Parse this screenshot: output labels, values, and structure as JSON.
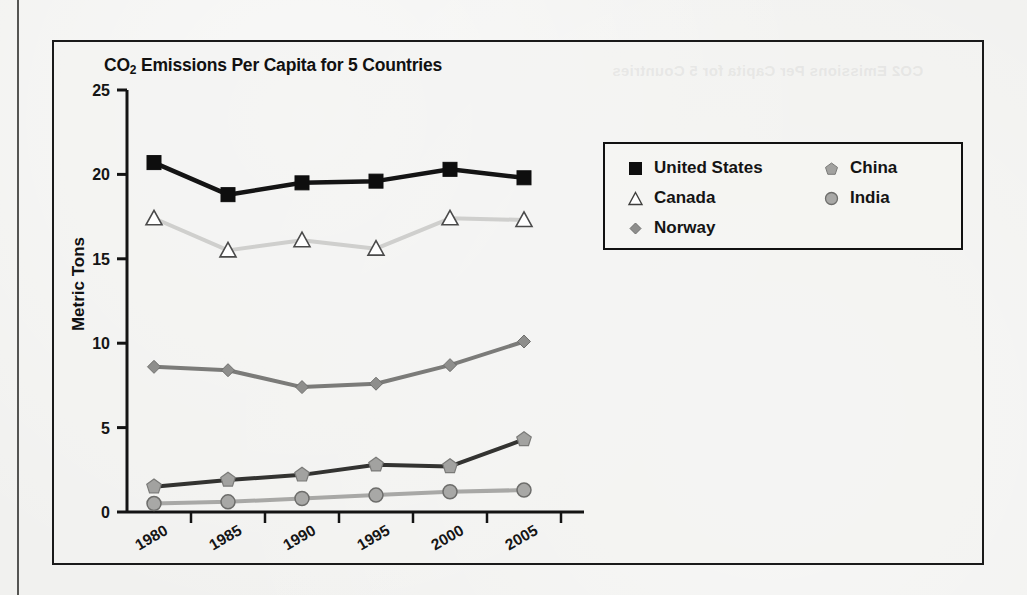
{
  "page": {
    "background_color": "#f1f1ef",
    "edge_line_color": "#555553",
    "showthrough": {
      "title": "CO2 Emissions Per Capita for 5 Countries",
      "line2": "",
      "line3": ""
    }
  },
  "chart_data": {
    "type": "line",
    "title": "CO2 Emissions Per Capita for 5 Countries",
    "title_prefix": "CO",
    "title_sub": "2",
    "title_rest": " Emissions Per Capita for 5 Countries",
    "xlabel": "",
    "ylabel": "Metric Tons",
    "categories": [
      "1980",
      "1985",
      "1990",
      "1995",
      "2000",
      "2005"
    ],
    "x": [
      1980,
      1985,
      1990,
      1995,
      2000,
      2005
    ],
    "ylim": [
      0,
      25
    ],
    "yticks": [
      0,
      5,
      10,
      15,
      20,
      25
    ],
    "ytick_labels": [
      "0",
      "5",
      "10",
      "15",
      "20",
      "25"
    ],
    "grid": false,
    "legend_position": "upper-right-inside",
    "series": [
      {
        "name": "United States",
        "marker": "square",
        "marker_fill": "#0e0e0e",
        "marker_stroke": "#0e0e0e",
        "line_color": "#141414",
        "line_width": 4.5,
        "values": [
          20.7,
          18.8,
          19.5,
          19.6,
          20.3,
          19.8
        ]
      },
      {
        "name": "Canada",
        "marker": "triangle",
        "marker_fill": "#ffffff",
        "marker_stroke": "#4a4a4a",
        "line_color": "#cfcfcd",
        "line_width": 4.0,
        "values": [
          17.4,
          15.5,
          16.1,
          15.6,
          17.4,
          17.3
        ]
      },
      {
        "name": "Norway",
        "marker": "diamond",
        "marker_fill": "#8e8e8c",
        "marker_stroke": "#6f6f6d",
        "line_color": "#7b7b79",
        "line_width": 4.0,
        "values": [
          8.6,
          8.4,
          7.4,
          7.6,
          8.7,
          10.1
        ]
      },
      {
        "name": "China",
        "marker": "pentagon",
        "marker_fill": "#a2a2a0",
        "marker_stroke": "#7a7a78",
        "line_color": "#333331",
        "line_width": 4.0,
        "values": [
          1.5,
          1.9,
          2.2,
          2.8,
          2.7,
          4.3
        ]
      },
      {
        "name": "India",
        "marker": "circle",
        "marker_fill": "#a8a8a6",
        "marker_stroke": "#6d6d6b",
        "line_color": "#a8a8a6",
        "line_width": 4.0,
        "values": [
          0.5,
          0.6,
          0.8,
          1.0,
          1.2,
          1.3
        ]
      }
    ]
  },
  "legend": {
    "column_left": [
      {
        "label": "United States",
        "marker": "square"
      },
      {
        "label": "Canada",
        "marker": "triangle"
      },
      {
        "label": "Norway",
        "marker": "diamond"
      }
    ],
    "column_right": [
      {
        "label": "China",
        "marker": "pentagon"
      },
      {
        "label": "India",
        "marker": "circle"
      }
    ]
  }
}
